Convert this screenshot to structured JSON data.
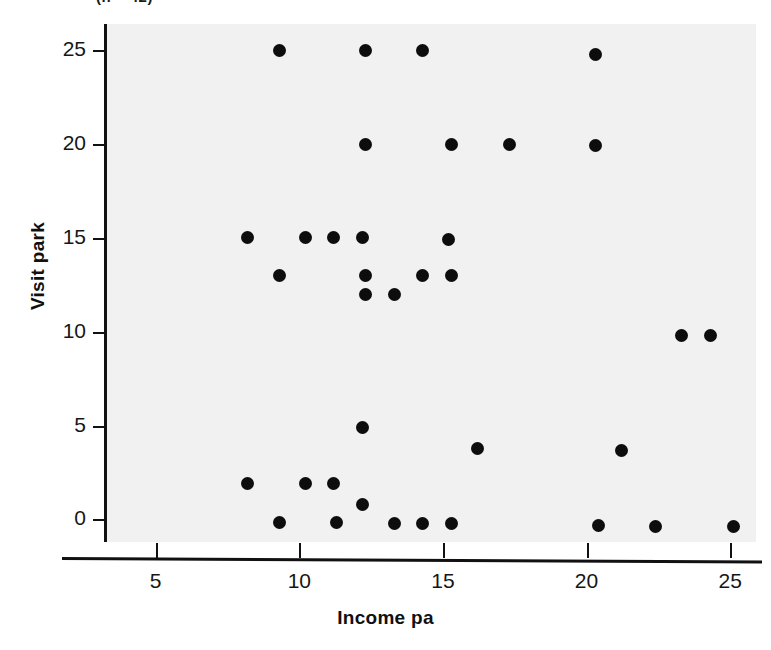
{
  "figure": {
    "top_caption_fragment": "(n = 42)",
    "background_color": "#ffffff",
    "plot_background_color": "#f1f1f1",
    "marker_color": "#0d0d0d",
    "axis_color": "#111111"
  },
  "chart_data": {
    "type": "scatter",
    "title": "",
    "xlabel": "Income pa",
    "ylabel": "Visit park",
    "xlim": [
      3.2,
      25.9
    ],
    "ylim": [
      -1.2,
      26.4
    ],
    "xticks": [
      5,
      10,
      15,
      20,
      25
    ],
    "yticks": [
      0,
      5,
      10,
      15,
      20,
      25
    ],
    "xtick_labels": [
      "5",
      "10",
      "15",
      "20",
      "25"
    ],
    "ytick_labels": [
      "0",
      "5",
      "10",
      "15",
      "20",
      "25"
    ],
    "grid": false,
    "legend": null,
    "series": [
      {
        "name": "respondents",
        "marker": "filled-circle",
        "points": [
          {
            "x": 9.2,
            "y": 25.0
          },
          {
            "x": 12.2,
            "y": 25.0
          },
          {
            "x": 14.2,
            "y": 25.0
          },
          {
            "x": 20.2,
            "y": 24.8
          },
          {
            "x": 12.2,
            "y": 20.0
          },
          {
            "x": 15.2,
            "y": 20.0
          },
          {
            "x": 17.2,
            "y": 20.0
          },
          {
            "x": 20.2,
            "y": 19.9
          },
          {
            "x": 8.1,
            "y": 15.0
          },
          {
            "x": 10.1,
            "y": 15.0
          },
          {
            "x": 11.1,
            "y": 15.0
          },
          {
            "x": 12.1,
            "y": 15.0
          },
          {
            "x": 15.1,
            "y": 14.9
          },
          {
            "x": 9.2,
            "y": 13.0
          },
          {
            "x": 12.2,
            "y": 13.0
          },
          {
            "x": 14.2,
            "y": 13.0
          },
          {
            "x": 15.2,
            "y": 13.0
          },
          {
            "x": 12.2,
            "y": 12.0
          },
          {
            "x": 13.2,
            "y": 12.0
          },
          {
            "x": 23.2,
            "y": 9.8
          },
          {
            "x": 24.2,
            "y": 9.8
          },
          {
            "x": 12.1,
            "y": 4.9
          },
          {
            "x": 16.1,
            "y": 3.8
          },
          {
            "x": 21.1,
            "y": 3.7
          },
          {
            "x": 8.1,
            "y": 1.9
          },
          {
            "x": 10.1,
            "y": 1.9
          },
          {
            "x": 11.1,
            "y": 1.9
          },
          {
            "x": 12.1,
            "y": 0.8
          },
          {
            "x": 9.2,
            "y": -0.15
          },
          {
            "x": 11.2,
            "y": -0.15
          },
          {
            "x": 13.2,
            "y": -0.2
          },
          {
            "x": 14.2,
            "y": -0.2
          },
          {
            "x": 15.2,
            "y": -0.2
          },
          {
            "x": 20.3,
            "y": -0.3
          },
          {
            "x": 22.3,
            "y": -0.35
          },
          {
            "x": 25.0,
            "y": -0.4
          }
        ]
      }
    ]
  }
}
